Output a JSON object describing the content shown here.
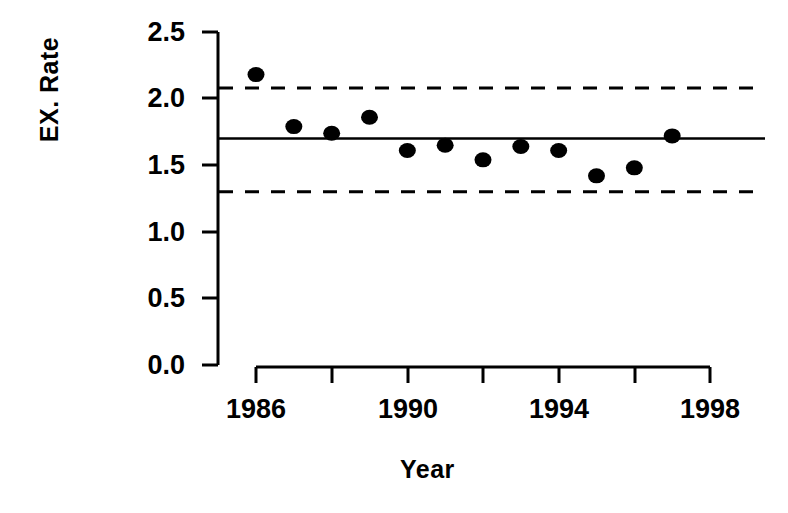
{
  "chart_data": {
    "type": "scatter",
    "title": "",
    "xlabel": "Year",
    "ylabel": "EX. Rate",
    "xlim": [
      1985.5,
      1998.0
    ],
    "ylim": [
      0.0,
      2.5
    ],
    "grid": false,
    "legend": null,
    "x_ticks": [
      1986,
      1988,
      1990,
      1992,
      1994,
      1996,
      1998
    ],
    "x_tick_labels": [
      "1986",
      "",
      "1990",
      "",
      "1994",
      "",
      "1998"
    ],
    "y_ticks": [
      0.0,
      0.5,
      1.0,
      1.5,
      2.0,
      2.5
    ],
    "y_tick_labels": [
      "0.0",
      "0.5",
      "1.0",
      "1.5",
      "2.0",
      "2.5"
    ],
    "x": [
      1986,
      1987,
      1988,
      1989,
      1990,
      1991,
      1992,
      1993,
      1994,
      1995,
      1996,
      1997
    ],
    "values": [
      2.18,
      1.79,
      1.74,
      1.86,
      1.61,
      1.65,
      1.54,
      1.64,
      1.61,
      1.42,
      1.48,
      1.72
    ],
    "series": [
      {
        "name": "EX. Rate",
        "marker": "filled-circle",
        "color": "#000000",
        "values": [
          2.18,
          1.79,
          1.74,
          1.86,
          1.61,
          1.65,
          1.54,
          1.64,
          1.61,
          1.42,
          1.48,
          1.72
        ]
      }
    ],
    "reference_lines": [
      {
        "name": "mean",
        "style": "solid",
        "value": 1.7,
        "color": "#000000"
      },
      {
        "name": "upper-limit",
        "style": "dashed",
        "value": 2.08,
        "color": "#000000"
      },
      {
        "name": "lower-limit",
        "style": "dashed",
        "value": 1.3,
        "color": "#000000"
      }
    ]
  },
  "axis": {
    "y_label": "EX. Rate",
    "x_label": "Year",
    "y_tick_labels": [
      "2.5",
      "2.0",
      "1.5",
      "1.0",
      "0.5",
      "0.0"
    ],
    "x_tick_labels": [
      "1986",
      "1990",
      "1994",
      "1998"
    ]
  }
}
